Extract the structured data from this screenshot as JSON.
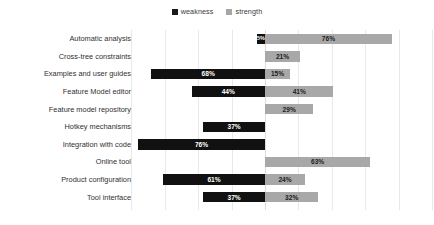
{
  "legend": {
    "position": "top-center",
    "entries": [
      {
        "label": "weakness",
        "color": "#111111",
        "swatch_name": "legend-swatch-weakness"
      },
      {
        "label": "strength",
        "color": "#a8a8a8",
        "swatch_name": "legend-swatch-strength"
      }
    ]
  },
  "chart_data": {
    "type": "bar",
    "orientation": "horizontal",
    "layout": "diverging",
    "title": "",
    "subtitle": "",
    "xlabel": "",
    "ylabel": "",
    "xlim": [
      -80,
      100
    ],
    "grid": true,
    "gridlines_x": [
      -80,
      -60,
      -40,
      -20,
      0,
      20,
      40,
      60,
      80,
      100
    ],
    "legend_position": "top-center",
    "value_suffix": "%",
    "categories": [
      "Automatic analysis",
      "Cross-tree constraints",
      "Examples and user guides",
      "Feature Model editor",
      "Feature model repository",
      "Hotkey mechanisms",
      "Integration with code",
      "Online tool",
      "Product configuration",
      "Tool interface"
    ],
    "series": [
      {
        "name": "weakness",
        "color": "#111111",
        "direction": "left",
        "values": [
          5,
          0,
          68,
          44,
          0,
          37,
          76,
          0,
          61,
          37
        ],
        "labels": [
          "5%",
          "",
          "68%",
          "44%",
          "",
          "37%",
          "76%",
          "",
          "61%",
          "37%"
        ]
      },
      {
        "name": "strength",
        "color": "#a8a8a8",
        "direction": "right",
        "values": [
          76,
          21,
          15,
          41,
          29,
          0,
          0,
          63,
          24,
          32
        ],
        "labels": [
          "76%",
          "21%",
          "15%",
          "41%",
          "29%",
          "",
          "",
          "63%",
          "24%",
          "32%"
        ]
      }
    ]
  },
  "axis": {
    "zero_x_px": 265,
    "px_per_percent": 1.67
  }
}
